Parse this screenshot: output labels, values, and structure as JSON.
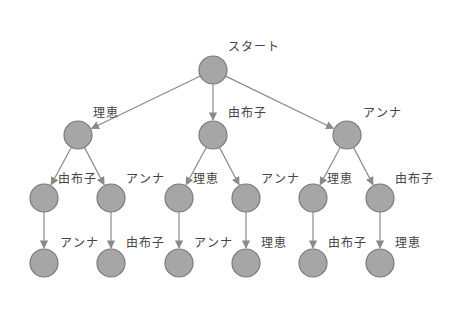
{
  "diagram": {
    "type": "tree",
    "node_fill": "#a6a6a6",
    "node_stroke": "#7a7a7a",
    "edge_color": "#8a8a8a",
    "nodes": [
      {
        "id": "root",
        "x": 213,
        "y": 70,
        "label": "スタート",
        "lx": 228,
        "ly": 40
      },
      {
        "id": "a",
        "x": 78,
        "y": 135,
        "label": "理恵",
        "lx": 93,
        "ly": 106
      },
      {
        "id": "b",
        "x": 213,
        "y": 135,
        "label": "由布子",
        "lx": 228,
        "ly": 106
      },
      {
        "id": "c",
        "x": 347,
        "y": 135,
        "label": "アンナ",
        "lx": 363,
        "ly": 106
      },
      {
        "id": "a1",
        "x": 44,
        "y": 198,
        "label": "由布子",
        "lx": 58,
        "ly": 172
      },
      {
        "id": "a2",
        "x": 111,
        "y": 198,
        "label": "アンナ",
        "lx": 126,
        "ly": 172
      },
      {
        "id": "b1",
        "x": 179,
        "y": 198,
        "label": "理恵",
        "lx": 193,
        "ly": 172
      },
      {
        "id": "b2",
        "x": 246,
        "y": 198,
        "label": "アンナ",
        "lx": 261,
        "ly": 172
      },
      {
        "id": "c1",
        "x": 313,
        "y": 198,
        "label": "理恵",
        "lx": 327,
        "ly": 172
      },
      {
        "id": "c2",
        "x": 380,
        "y": 198,
        "label": "由布子",
        "lx": 395,
        "ly": 172
      },
      {
        "id": "a1x",
        "x": 44,
        "y": 263,
        "label": "アンナ",
        "lx": 60,
        "ly": 236
      },
      {
        "id": "a2x",
        "x": 111,
        "y": 263,
        "label": "由布子",
        "lx": 126,
        "ly": 236
      },
      {
        "id": "b1x",
        "x": 179,
        "y": 263,
        "label": "アンナ",
        "lx": 194,
        "ly": 236
      },
      {
        "id": "b2x",
        "x": 246,
        "y": 263,
        "label": "理恵",
        "lx": 261,
        "ly": 236
      },
      {
        "id": "c1x",
        "x": 313,
        "y": 263,
        "label": "由布子",
        "lx": 328,
        "ly": 236
      },
      {
        "id": "c2x",
        "x": 380,
        "y": 263,
        "label": "理恵",
        "lx": 395,
        "ly": 236
      }
    ],
    "edges": [
      [
        "root",
        "a"
      ],
      [
        "root",
        "b"
      ],
      [
        "root",
        "c"
      ],
      [
        "a",
        "a1"
      ],
      [
        "a",
        "a2"
      ],
      [
        "b",
        "b1"
      ],
      [
        "b",
        "b2"
      ],
      [
        "c",
        "c1"
      ],
      [
        "c",
        "c2"
      ],
      [
        "a1",
        "a1x"
      ],
      [
        "a2",
        "a2x"
      ],
      [
        "b1",
        "b1x"
      ],
      [
        "b2",
        "b2x"
      ],
      [
        "c1",
        "c1x"
      ],
      [
        "c2",
        "c2x"
      ]
    ]
  }
}
